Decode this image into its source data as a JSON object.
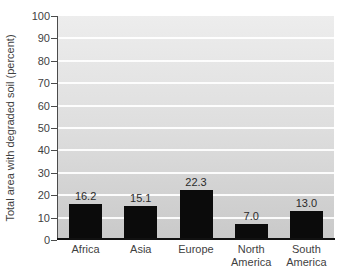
{
  "chart_data": {
    "type": "bar",
    "title": "",
    "ylabel": "Total area with degraded soil (percent)",
    "xlabel": "",
    "categories": [
      "Africa",
      "Asia",
      "Europe",
      "North America",
      "South America"
    ],
    "values": [
      16.2,
      15.1,
      22.3,
      7.0,
      13.0
    ],
    "value_labels": [
      "16.2",
      "15.1",
      "22.3",
      "7.0",
      "13.0"
    ],
    "ylim": [
      0,
      100
    ],
    "ytick_step": 10,
    "ytick_labels": [
      "0",
      "10",
      "20",
      "30",
      "40",
      "50",
      "60",
      "70",
      "80",
      "90",
      "100"
    ],
    "grid": true,
    "legend": "none",
    "bar_color": "#0b0b0b",
    "plot_bg_top": "#ededed",
    "plot_bg_bottom": "#c9c9c9",
    "gridline_color": "#ffffff",
    "axis_color": "#111111",
    "text_color": "#3f3f3f"
  }
}
